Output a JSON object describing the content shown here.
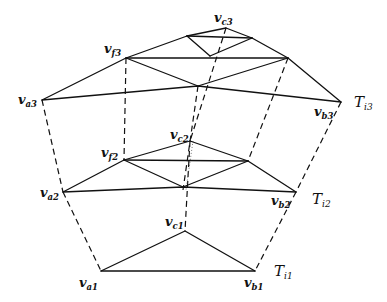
{
  "diagram": {
    "title": "",
    "levels": [
      {
        "name": "T",
        "sub": "i3",
        "vertices": {
          "a": {
            "label": "v",
            "sub": "a3"
          },
          "f": {
            "label": "v",
            "sub": "f3"
          },
          "c": {
            "label": "v",
            "sub": "c3"
          },
          "b": {
            "label": "v",
            "sub": "b3"
          }
        }
      },
      {
        "name": "T",
        "sub": "i2",
        "vertices": {
          "a": {
            "label": "v",
            "sub": "a2"
          },
          "f": {
            "label": "v",
            "sub": "f2"
          },
          "c": {
            "label": "v",
            "sub": "c2"
          },
          "b": {
            "label": "v",
            "sub": "b2"
          }
        }
      },
      {
        "name": "T",
        "sub": "i1",
        "vertices": {
          "a": {
            "label": "v",
            "sub": "a1"
          },
          "c": {
            "label": "v",
            "sub": "c1"
          },
          "b": {
            "label": "v",
            "sub": "b1"
          }
        }
      }
    ],
    "edge_styles": {
      "solid": "triangle edges within a level",
      "dashed": "correspondence between levels"
    }
  }
}
